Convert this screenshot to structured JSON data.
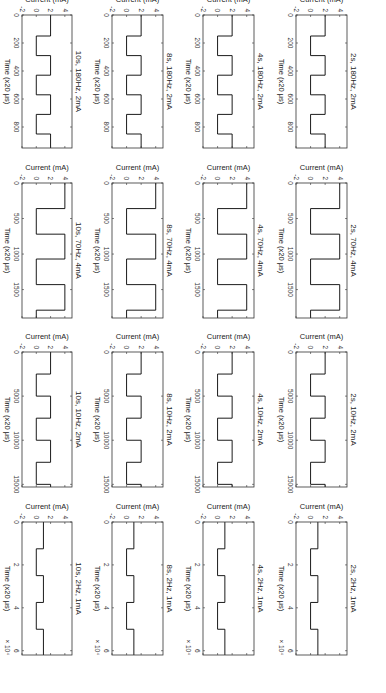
{
  "figure": {
    "orientation": "rotated-90-clockwise",
    "line_color": "#000000",
    "axis_color": "#333333"
  },
  "chart_data": [
    {
      "type": "line",
      "title": "2s, 180Hz, 2mA",
      "row": 0,
      "col": 0,
      "xlabel": "Time (x20 μs)",
      "ylabel": "Current (mA)",
      "xlim": [
        0,
        950
      ],
      "ylim": [
        -2,
        5
      ],
      "xticks": [
        0,
        200,
        400,
        600,
        800
      ],
      "yticks": [
        -2,
        0,
        2,
        4
      ],
      "x_multiplier": "",
      "x": [
        0,
        150,
        150,
        290,
        290,
        430,
        430,
        570,
        570,
        710,
        710,
        850,
        850,
        950
      ],
      "y": [
        2,
        2,
        0,
        0,
        2,
        2,
        0,
        0,
        2,
        2,
        0,
        0,
        2,
        2
      ]
    },
    {
      "type": "line",
      "title": "2s, 70Hz, 4mA",
      "row": 0,
      "col": 1,
      "xlabel": "Time (x20 μs)",
      "ylabel": "Current (mA)",
      "xlim": [
        0,
        1900
      ],
      "ylim": [
        -2,
        5
      ],
      "xticks": [
        0,
        500,
        1000,
        1500
      ],
      "yticks": [
        -2,
        0,
        2,
        4
      ],
      "x_multiplier": "",
      "x": [
        0,
        360,
        360,
        720,
        720,
        1070,
        1070,
        1430,
        1430,
        1790,
        1790,
        1900
      ],
      "y": [
        4,
        4,
        0,
        0,
        4,
        4,
        0,
        0,
        4,
        4,
        0,
        0
      ]
    },
    {
      "type": "line",
      "title": "2s, 10Hz, 2mA",
      "row": 0,
      "col": 2,
      "xlabel": "Time (x20 μs)",
      "ylabel": "Current (mA)",
      "xlim": [
        0,
        15300
      ],
      "ylim": [
        -2,
        5
      ],
      "xticks": [
        0,
        5000,
        10000,
        15000
      ],
      "yticks": [
        -2,
        0,
        2,
        4
      ],
      "x_multiplier": "",
      "x": [
        0,
        2500,
        2500,
        5000,
        5000,
        7500,
        7500,
        10000,
        10000,
        12500,
        12500,
        15000,
        15000,
        15300
      ],
      "y": [
        2,
        2,
        0,
        0,
        2,
        2,
        0,
        0,
        2,
        2,
        0,
        0,
        2,
        2
      ]
    },
    {
      "type": "line",
      "title": "2s, 2Hz, 1mA",
      "row": 0,
      "col": 3,
      "xlabel": "Time (x20 μs)",
      "ylabel": "Current (mA)",
      "xlim": [
        0,
        62000
      ],
      "ylim": [
        -2,
        5
      ],
      "xticks": [
        0,
        20000,
        40000,
        60000
      ],
      "xtick_labels": [
        "0",
        "2",
        "4",
        "6"
      ],
      "yticks": [
        -2,
        0,
        2,
        4
      ],
      "x_multiplier": "× 10⁴",
      "x": [
        0,
        12500,
        12500,
        25000,
        25000,
        37500,
        37500,
        50000,
        50000,
        62000
      ],
      "y": [
        1,
        1,
        0,
        0,
        1,
        1,
        0,
        0,
        1,
        1
      ]
    },
    {
      "type": "line",
      "title": "4s, 180Hz, 2mA",
      "row": 1,
      "col": 0,
      "xlabel": "Time (x20 μs)",
      "ylabel": "Current (mA)",
      "xlim": [
        0,
        950
      ],
      "ylim": [
        -2,
        5
      ],
      "xticks": [
        0,
        200,
        400,
        600,
        800
      ],
      "yticks": [
        -2,
        0,
        2,
        4
      ],
      "x_multiplier": "",
      "x": [
        0,
        150,
        150,
        290,
        290,
        430,
        430,
        570,
        570,
        710,
        710,
        850,
        850,
        950
      ],
      "y": [
        2,
        2,
        0,
        0,
        2,
        2,
        0,
        0,
        2,
        2,
        0,
        0,
        2,
        2
      ]
    },
    {
      "type": "line",
      "title": "4s, 70Hz, 4mA",
      "row": 1,
      "col": 1,
      "xlabel": "Time (x20 μs)",
      "ylabel": "Current (mA)",
      "xlim": [
        0,
        1900
      ],
      "ylim": [
        -2,
        5
      ],
      "xticks": [
        0,
        500,
        1000,
        1500
      ],
      "yticks": [
        -2,
        0,
        2,
        4
      ],
      "x_multiplier": "",
      "x": [
        0,
        360,
        360,
        720,
        720,
        1070,
        1070,
        1430,
        1430,
        1790,
        1790,
        1900
      ],
      "y": [
        4,
        4,
        0,
        0,
        4,
        4,
        0,
        0,
        4,
        4,
        0,
        0
      ]
    },
    {
      "type": "line",
      "title": "4s, 10Hz, 2mA",
      "row": 1,
      "col": 2,
      "xlabel": "Time (x20 μs)",
      "ylabel": "Current (mA)",
      "xlim": [
        0,
        15300
      ],
      "ylim": [
        -2,
        5
      ],
      "xticks": [
        0,
        5000,
        10000,
        15000
      ],
      "yticks": [
        -2,
        0,
        2,
        4
      ],
      "x_multiplier": "",
      "x": [
        0,
        2500,
        2500,
        5000,
        5000,
        7500,
        7500,
        10000,
        10000,
        12500,
        12500,
        15000,
        15000,
        15300
      ],
      "y": [
        2,
        2,
        0,
        0,
        2,
        2,
        0,
        0,
        2,
        2,
        0,
        0,
        2,
        2
      ]
    },
    {
      "type": "line",
      "title": "4s, 2Hz, 1mA",
      "row": 1,
      "col": 3,
      "xlabel": "Time (x20 μs)",
      "ylabel": "Current (mA)",
      "xlim": [
        0,
        62000
      ],
      "ylim": [
        -2,
        5
      ],
      "xticks": [
        0,
        20000,
        40000,
        60000
      ],
      "xtick_labels": [
        "0",
        "2",
        "4",
        "6"
      ],
      "yticks": [
        -2,
        0,
        2,
        4
      ],
      "x_multiplier": "× 10⁴",
      "x": [
        0,
        12500,
        12500,
        25000,
        25000,
        37500,
        37500,
        50000,
        50000,
        62000
      ],
      "y": [
        1,
        1,
        0,
        0,
        1,
        1,
        0,
        0,
        1,
        1
      ]
    },
    {
      "type": "line",
      "title": "8s, 180Hz, 2mA",
      "row": 2,
      "col": 0,
      "xlabel": "Time (x20 μs)",
      "ylabel": "Current (mA)",
      "xlim": [
        0,
        950
      ],
      "ylim": [
        -2,
        5
      ],
      "xticks": [
        0,
        200,
        400,
        600,
        800
      ],
      "yticks": [
        -2,
        0,
        2,
        4
      ],
      "x_multiplier": "",
      "x": [
        0,
        150,
        150,
        290,
        290,
        430,
        430,
        570,
        570,
        710,
        710,
        850,
        850,
        950
      ],
      "y": [
        2,
        2,
        0,
        0,
        2,
        2,
        0,
        0,
        2,
        2,
        0,
        0,
        2,
        2
      ]
    },
    {
      "type": "line",
      "title": "8s, 70Hz, 4mA",
      "row": 2,
      "col": 1,
      "xlabel": "Time (x20 μs)",
      "ylabel": "Current (mA)",
      "xlim": [
        0,
        1900
      ],
      "ylim": [
        -2,
        5
      ],
      "xticks": [
        0,
        500,
        1000,
        1500
      ],
      "yticks": [
        -2,
        0,
        2,
        4
      ],
      "x_multiplier": "",
      "x": [
        0,
        360,
        360,
        720,
        720,
        1070,
        1070,
        1430,
        1430,
        1790,
        1790,
        1900
      ],
      "y": [
        4,
        4,
        0,
        0,
        4,
        4,
        0,
        0,
        4,
        4,
        0,
        0
      ]
    },
    {
      "type": "line",
      "title": "8s, 10Hz, 2mA",
      "row": 2,
      "col": 2,
      "xlabel": "Time (x20 μs)",
      "ylabel": "Current (mA)",
      "xlim": [
        0,
        15300
      ],
      "ylim": [
        -2,
        5
      ],
      "xticks": [
        0,
        5000,
        10000,
        15000
      ],
      "yticks": [
        -2,
        0,
        2,
        4
      ],
      "x_multiplier": "",
      "x": [
        0,
        2500,
        2500,
        5000,
        5000,
        7500,
        7500,
        10000,
        10000,
        12500,
        12500,
        15000,
        15000,
        15300
      ],
      "y": [
        2,
        2,
        0,
        0,
        2,
        2,
        0,
        0,
        2,
        2,
        0,
        0,
        2,
        2
      ]
    },
    {
      "type": "line",
      "title": "8s, 2Hz, 1mA",
      "row": 2,
      "col": 3,
      "xlabel": "Time (x20 μs)",
      "ylabel": "Current (mA)",
      "xlim": [
        0,
        62000
      ],
      "ylim": [
        -2,
        5
      ],
      "xticks": [
        0,
        20000,
        40000,
        60000
      ],
      "xtick_labels": [
        "0",
        "2",
        "4",
        "6"
      ],
      "yticks": [
        -2,
        0,
        2,
        4
      ],
      "x_multiplier": "× 10⁴",
      "x": [
        0,
        12500,
        12500,
        25000,
        25000,
        37500,
        37500,
        50000,
        50000,
        62000
      ],
      "y": [
        1,
        1,
        0,
        0,
        1,
        1,
        0,
        0,
        1,
        1
      ]
    },
    {
      "type": "line",
      "title": "10s, 180Hz, 2mA",
      "row": 3,
      "col": 0,
      "xlabel": "Time (x20 μs)",
      "ylabel": "Current (mA)",
      "xlim": [
        0,
        950
      ],
      "ylim": [
        -2,
        5
      ],
      "xticks": [
        0,
        200,
        400,
        600,
        800
      ],
      "yticks": [
        -2,
        0,
        2,
        4
      ],
      "x_multiplier": "",
      "x": [
        0,
        150,
        150,
        290,
        290,
        430,
        430,
        570,
        570,
        710,
        710,
        850,
        850,
        950
      ],
      "y": [
        2,
        2,
        0,
        0,
        2,
        2,
        0,
        0,
        2,
        2,
        0,
        0,
        2,
        2
      ]
    },
    {
      "type": "line",
      "title": "10s, 70Hz, 4mA",
      "row": 3,
      "col": 1,
      "xlabel": "Time (x20 μs)",
      "ylabel": "Current (mA)",
      "xlim": [
        0,
        1900
      ],
      "ylim": [
        -2,
        5
      ],
      "xticks": [
        0,
        500,
        1000,
        1500
      ],
      "yticks": [
        -2,
        0,
        2,
        4
      ],
      "x_multiplier": "",
      "x": [
        0,
        360,
        360,
        720,
        720,
        1070,
        1070,
        1430,
        1430,
        1790,
        1790,
        1900
      ],
      "y": [
        4,
        4,
        0,
        0,
        4,
        4,
        0,
        0,
        4,
        4,
        0,
        0
      ]
    },
    {
      "type": "line",
      "title": "10s, 10Hz, 2mA",
      "row": 3,
      "col": 2,
      "xlabel": "Time (x20 μs)",
      "ylabel": "Current (mA)",
      "xlim": [
        0,
        15300
      ],
      "ylim": [
        -2,
        5
      ],
      "xticks": [
        0,
        5000,
        10000,
        15000
      ],
      "yticks": [
        -2,
        0,
        2,
        4
      ],
      "x_multiplier": "",
      "x": [
        0,
        2500,
        2500,
        5000,
        5000,
        7500,
        7500,
        10000,
        10000,
        12500,
        12500,
        15000,
        15000,
        15300
      ],
      "y": [
        2,
        2,
        0,
        0,
        2,
        2,
        0,
        0,
        2,
        2,
        0,
        0,
        2,
        2
      ]
    },
    {
      "type": "line",
      "title": "10s, 2Hz, 1mA",
      "row": 3,
      "col": 3,
      "xlabel": "Time (x20 μs)",
      "ylabel": "Current (mA)",
      "xlim": [
        0,
        62000
      ],
      "ylim": [
        -2,
        5
      ],
      "xticks": [
        0,
        20000,
        40000,
        60000
      ],
      "xtick_labels": [
        "0",
        "2",
        "4",
        "6"
      ],
      "yticks": [
        -2,
        0,
        2,
        4
      ],
      "x_multiplier": "× 10⁴",
      "x": [
        0,
        12500,
        12500,
        25000,
        25000,
        37500,
        37500,
        50000,
        50000,
        62000
      ],
      "y": [
        1,
        1,
        0,
        0,
        1,
        1,
        0,
        0,
        1,
        1
      ]
    }
  ]
}
